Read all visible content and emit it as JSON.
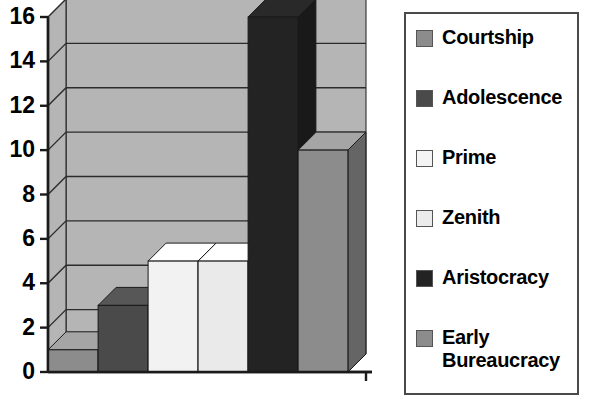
{
  "chart_data": {
    "type": "bar",
    "title": "",
    "xlabel": "",
    "ylabel": "",
    "categories": [
      "Courtship",
      "Adolescence",
      "Prime",
      "Zenith",
      "Aristocracy",
      "Early Bureaucracy"
    ],
    "values": [
      1,
      3,
      5,
      5,
      16,
      10
    ],
    "series": [
      {
        "name": "Stages",
        "values": [
          1,
          3,
          5,
          5,
          16,
          10
        ]
      }
    ],
    "ylim": [
      0,
      16
    ],
    "ytick_labels": [
      "16",
      "14",
      "12",
      "10",
      "8",
      "6",
      "4",
      "2",
      "0"
    ],
    "ytick_values": [
      16,
      14,
      12,
      10,
      8,
      6,
      4,
      2,
      0
    ],
    "ytick_interval": 2,
    "grid": true,
    "grid_axis": "y",
    "xtick_labels": [],
    "legend_position": "right",
    "style": "3d-column",
    "bar_colors": [
      "#8c8c8c",
      "#4a4a4a",
      "#f2f2f2",
      "#eaeaea",
      "#232323",
      "#8c8c8c"
    ],
    "annotations": []
  },
  "plot": {
    "background": "#b5b5b5",
    "floor_color": "#9a9a9a",
    "axis_color": "#1a1a1a",
    "gridline_color": "#2b2b2b"
  },
  "legend": {
    "border_color": "#4a4a4a",
    "background": "#ffffff",
    "items": [
      {
        "label": "Courtship",
        "label_line2": "",
        "color": "#8c8c8c"
      },
      {
        "label": "Adolescence",
        "label_line2": "",
        "color": "#4a4a4a"
      },
      {
        "label": "Prime",
        "label_line2": "",
        "color": "#f4f4f4"
      },
      {
        "label": "Zenith",
        "label_line2": "",
        "color": "#ebebeb"
      },
      {
        "label": "Aristocracy",
        "label_line2": "",
        "color": "#232323"
      },
      {
        "label": "Early",
        "label_line2": "Bureaucracy",
        "color": "#8c8c8c"
      }
    ]
  }
}
